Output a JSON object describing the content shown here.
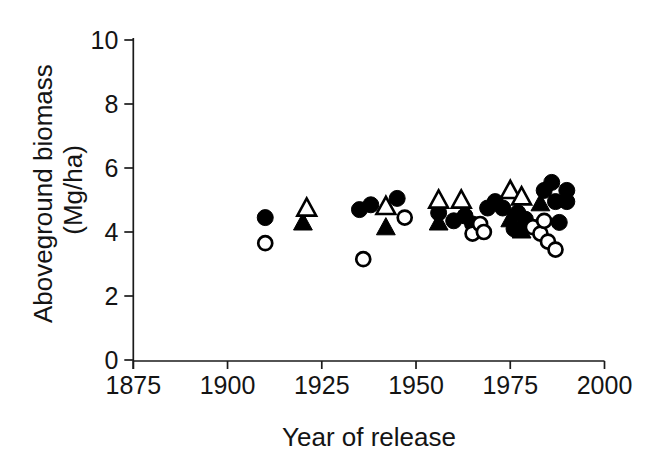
{
  "figure": {
    "background": "#ffffff",
    "ink": "#1a1a1a",
    "marker_color": "#000000"
  },
  "chart_data": {
    "type": "scatter",
    "title": "",
    "xlabel": "Year of release",
    "ylabel": "Aboveground biomass (Mg/ha)",
    "ylabel_lines": [
      "Aboveground biomass",
      "(Mg/ha)"
    ],
    "xlim": [
      1875,
      2000
    ],
    "ylim": [
      0,
      10
    ],
    "xticks": [
      1875,
      1900,
      1925,
      1950,
      1975,
      2000
    ],
    "yticks": [
      0,
      2,
      4,
      6,
      8,
      10
    ],
    "grid": false,
    "legend": "none",
    "series": [
      {
        "name": "filled-circle",
        "marker": "circle",
        "fill": "black",
        "points": [
          [
            1910,
            4.45
          ],
          [
            1935,
            4.7
          ],
          [
            1938,
            4.85
          ],
          [
            1945,
            5.05
          ],
          [
            1956,
            4.6
          ],
          [
            1960,
            4.35
          ],
          [
            1963,
            4.5
          ],
          [
            1965,
            4.25
          ],
          [
            1969,
            4.75
          ],
          [
            1971,
            4.95
          ],
          [
            1973,
            4.75
          ],
          [
            1976,
            4.1
          ],
          [
            1977,
            4.6
          ],
          [
            1979,
            4.4
          ],
          [
            1984,
            5.3
          ],
          [
            1986,
            5.55
          ],
          [
            1987,
            4.95
          ],
          [
            1988,
            4.3
          ],
          [
            1990,
            5.3
          ],
          [
            1990,
            4.95
          ]
        ]
      },
      {
        "name": "open-circle",
        "marker": "circle",
        "fill": "white",
        "points": [
          [
            1910,
            3.65
          ],
          [
            1936,
            3.15
          ],
          [
            1947,
            4.45
          ],
          [
            1965,
            3.95
          ],
          [
            1967,
            4.25
          ],
          [
            1968,
            4.0
          ],
          [
            1981,
            4.15
          ],
          [
            1983,
            3.95
          ],
          [
            1984,
            4.35
          ],
          [
            1985,
            3.7
          ],
          [
            1987,
            3.45
          ]
        ]
      },
      {
        "name": "filled-triangle",
        "marker": "triangle",
        "fill": "black",
        "points": [
          [
            1920,
            4.3
          ],
          [
            1942,
            4.15
          ],
          [
            1956,
            4.3
          ],
          [
            1975,
            4.4
          ],
          [
            1978,
            4.05
          ],
          [
            1983,
            4.9
          ]
        ]
      },
      {
        "name": "open-triangle",
        "marker": "triangle",
        "fill": "white",
        "points": [
          [
            1921,
            4.75
          ],
          [
            1942,
            4.8
          ],
          [
            1956,
            5.0
          ],
          [
            1962,
            5.0
          ],
          [
            1975,
            5.3
          ],
          [
            1978,
            5.1
          ]
        ]
      }
    ]
  }
}
